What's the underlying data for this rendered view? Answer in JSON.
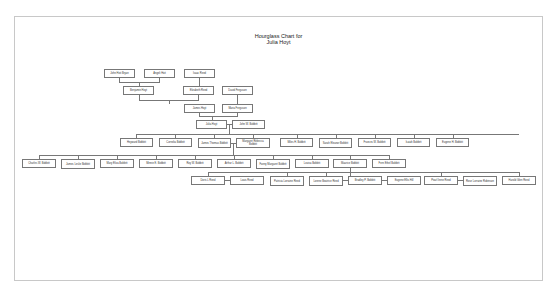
{
  "chart": {
    "title_line1": "Hourglass Chart for",
    "title_line2": "Julia Hoyt"
  },
  "ancestors": {
    "great_grandparents": [
      {
        "name": "John Hoit Bryan"
      },
      {
        "name": "Angeli Hoit"
      },
      {
        "name": "Isaac Reed"
      }
    ],
    "grandparents": [
      {
        "name": "Benjamin Hoyt"
      },
      {
        "name": "Elizabeth Reed"
      },
      {
        "name": "David Ferguson"
      }
    ],
    "parents": [
      {
        "name": "James Hoyt"
      },
      {
        "name": "Maria Ferguson"
      }
    ],
    "focus": {
      "name": "Julia Hoyt"
    },
    "spouse": {
      "name": "John W. Bobbitt"
    }
  },
  "children": [
    {
      "name": "Heyward Bobbitt"
    },
    {
      "name": "Cornelia Bobbitt"
    },
    {
      "name": "James Thomas Bobbitt"
    },
    {
      "name": "Margaret Rebecca Bobbitt"
    },
    {
      "name": "Miles H. Bobbitt"
    },
    {
      "name": "Sarah Eleanor Bobbitt"
    },
    {
      "name": "Frances W. Bobbitt"
    },
    {
      "name": "Isaiah Bobbitt"
    },
    {
      "name": "Eugene H. Bobbitt"
    }
  ],
  "grandchildren": [
    {
      "name": "Charles W. Bobbitt"
    },
    {
      "name": "James Leslie Bobbitt"
    },
    {
      "name": "Mary Eliza Bobbitt"
    },
    {
      "name": "Minnie E. Bobbitt"
    },
    {
      "name": "Roy W. Bobbitt"
    },
    {
      "name": "Arthur L. Bobbitt"
    },
    {
      "name": "Fanny Margaret Bobbitt"
    },
    {
      "name": "Louisa Bobbitt"
    },
    {
      "name": "Maurice Bobbitt"
    },
    {
      "name": "Fern Ethel Bobbitt"
    }
  ],
  "great_grandchildren": [
    {
      "name": "Doris L Reed"
    },
    {
      "name": "Louis Reed"
    },
    {
      "name": "Patricia Lorraine Reed"
    },
    {
      "name": "Lorene Beatrice Reed"
    },
    {
      "name": "Bradley P. Bobbitt"
    },
    {
      "name": "Eugene Ellis Hill"
    },
    {
      "name": "Pearl Irene Reed"
    },
    {
      "name": "Rose Lorraine Robinson"
    },
    {
      "name": "Harold Glen Reed"
    }
  ]
}
